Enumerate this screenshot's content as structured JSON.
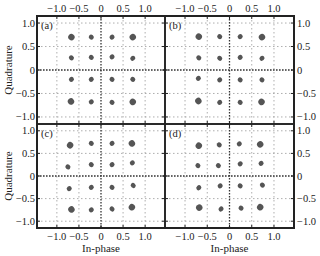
{
  "figure": {
    "xlabel": "In-phase",
    "ylabel": "Quadrature",
    "x_ticks": [
      "−1.0",
      "−0.5",
      "0",
      "0.5",
      "1.0"
    ],
    "y_ticks": [
      "1.0",
      "0.5",
      "0",
      "−0.5",
      "−1.0"
    ]
  },
  "chart_data": [
    {
      "type": "scatter",
      "title": "(a)",
      "xlabel": "In-phase",
      "ylabel": "Quadrature",
      "xlim": [
        -1.45,
        1.45
      ],
      "ylim": [
        -1.15,
        1.15
      ],
      "grid": true,
      "points": [
        [
          -0.67,
          0.7
        ],
        [
          -0.22,
          0.7
        ],
        [
          0.25,
          0.7
        ],
        [
          0.72,
          0.7
        ],
        [
          -0.67,
          0.26
        ],
        [
          -0.22,
          0.27
        ],
        [
          0.25,
          0.28
        ],
        [
          0.72,
          0.25
        ],
        [
          -0.67,
          -0.2
        ],
        [
          -0.22,
          -0.2
        ],
        [
          0.25,
          -0.2
        ],
        [
          0.72,
          -0.2
        ],
        [
          -0.68,
          -0.67
        ],
        [
          -0.22,
          -0.68
        ],
        [
          0.25,
          -0.69
        ],
        [
          0.72,
          -0.68
        ]
      ]
    },
    {
      "type": "scatter",
      "title": "(b)",
      "xlabel": "In-phase",
      "ylabel": "Quadrature",
      "xlim": [
        -1.45,
        1.45
      ],
      "ylim": [
        -1.15,
        1.15
      ],
      "grid": true,
      "points": [
        [
          -0.69,
          0.71
        ],
        [
          -0.22,
          0.71
        ],
        [
          0.24,
          0.71
        ],
        [
          0.73,
          0.7
        ],
        [
          -0.69,
          0.26
        ],
        [
          -0.22,
          0.25
        ],
        [
          0.24,
          0.27
        ],
        [
          0.73,
          0.25
        ],
        [
          -0.7,
          -0.18
        ],
        [
          -0.22,
          -0.21
        ],
        [
          0.24,
          -0.21
        ],
        [
          0.73,
          -0.21
        ],
        [
          -0.7,
          -0.66
        ],
        [
          -0.22,
          -0.69
        ],
        [
          0.24,
          -0.69
        ],
        [
          0.72,
          -0.68
        ]
      ]
    },
    {
      "type": "scatter",
      "title": "(c)",
      "xlabel": "In-phase",
      "ylabel": "Quadrature",
      "xlim": [
        -1.45,
        1.45
      ],
      "ylim": [
        -1.15,
        1.15
      ],
      "grid": true,
      "points": [
        [
          -0.7,
          0.68
        ],
        [
          -0.22,
          0.72
        ],
        [
          0.25,
          0.72
        ],
        [
          0.7,
          0.72
        ],
        [
          -0.75,
          0.2
        ],
        [
          -0.22,
          0.25
        ],
        [
          0.25,
          0.25
        ],
        [
          0.71,
          0.29
        ],
        [
          -0.72,
          -0.28
        ],
        [
          -0.22,
          -0.25
        ],
        [
          0.25,
          -0.25
        ],
        [
          0.73,
          -0.21
        ],
        [
          -0.67,
          -0.74
        ],
        [
          -0.22,
          -0.75
        ],
        [
          0.25,
          -0.73
        ],
        [
          0.7,
          -0.69
        ]
      ]
    },
    {
      "type": "scatter",
      "title": "(d)",
      "xlabel": "In-phase",
      "ylabel": "Quadrature",
      "xlim": [
        -1.45,
        1.45
      ],
      "ylim": [
        -1.15,
        1.15
      ],
      "grid": true,
      "points": [
        [
          -0.69,
          0.67
        ],
        [
          -0.23,
          0.69
        ],
        [
          0.22,
          0.71
        ],
        [
          0.69,
          0.7
        ],
        [
          -0.71,
          0.23
        ],
        [
          -0.25,
          0.23
        ],
        [
          0.24,
          0.27
        ],
        [
          0.71,
          0.28
        ],
        [
          -0.69,
          -0.26
        ],
        [
          -0.21,
          -0.22
        ],
        [
          0.24,
          -0.22
        ],
        [
          0.74,
          -0.2
        ],
        [
          -0.68,
          -0.7
        ],
        [
          -0.19,
          -0.73
        ],
        [
          0.26,
          -0.71
        ],
        [
          0.69,
          -0.69
        ]
      ]
    }
  ]
}
